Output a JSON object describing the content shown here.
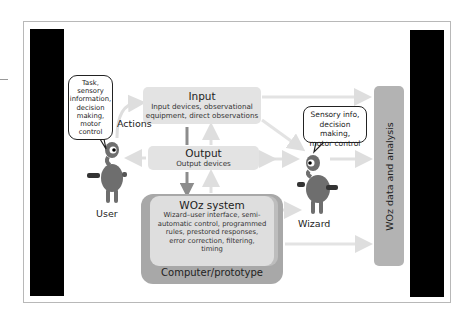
{
  "diagram": {
    "nodes": {
      "input": {
        "title": "Input",
        "description_line1": "Input devices, observational",
        "description_line2": "equipment, direct observations"
      },
      "output": {
        "title": "Output",
        "description": "Output devices"
      },
      "woz_system": {
        "title": "WOz system",
        "lines": [
          "Wizard–user interface, semi-",
          "automatic control, programmed",
          "rules, prestored responses,",
          "error correction, filtering,",
          "timing"
        ]
      },
      "computer": {
        "label": "Computer/prototype"
      },
      "data_analysis": {
        "label": "WOz data and analysis"
      }
    },
    "actors": {
      "user": {
        "label": "User",
        "bubble_lines": [
          "Task,",
          "sensory",
          "information,",
          "decision",
          "making,",
          "motor",
          "control"
        ]
      },
      "wizard": {
        "label": "Wizard",
        "bubble_lines": [
          "Sensory info,",
          "decision making,",
          "motor control"
        ]
      }
    },
    "edge_labels": {
      "actions": "Actions"
    },
    "colors": {
      "box_light": "#e3e3e3",
      "box_dark": "#a8a8a8",
      "data_bar": "#b3b3b3",
      "arrow_light": "#e0e0e0",
      "arrow_dark": "#8c8c8c",
      "character": "#6e6e6e",
      "side_bars": "#000000"
    }
  }
}
